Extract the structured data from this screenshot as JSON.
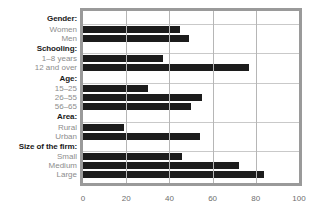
{
  "chart_data": {
    "type": "bar",
    "orientation": "horizontal",
    "title": "",
    "xlabel": "",
    "ylabel": "",
    "xlim": [
      0,
      100
    ],
    "xticks": [
      0,
      20,
      40,
      60,
      80,
      100
    ],
    "grid": true,
    "legend": false,
    "groups": [
      {
        "header": "Gender:",
        "categories": [
          "Women",
          "Men"
        ],
        "values": [
          45,
          49
        ]
      },
      {
        "header": "Schooling:",
        "categories": [
          "1–8 years",
          "12 and over"
        ],
        "values": [
          37,
          77
        ]
      },
      {
        "header": "Age:",
        "categories": [
          "15–25",
          "26–55",
          "56–65"
        ],
        "values": [
          30,
          55,
          50
        ]
      },
      {
        "header": "Area:",
        "categories": [
          "Rural",
          "Urban"
        ],
        "values": [
          19,
          54
        ]
      },
      {
        "header": "Size of the firm:",
        "categories": [
          "Small",
          "Medium",
          "Large"
        ],
        "values": [
          46,
          72,
          84
        ]
      }
    ],
    "categories": [
      "Women",
      "Men",
      "1–8 years",
      "12 and over",
      "15–25",
      "26–55",
      "56–65",
      "Rural",
      "Urban",
      "Small",
      "Medium",
      "Large"
    ],
    "values": [
      45,
      49,
      37,
      77,
      30,
      55,
      50,
      19,
      54,
      46,
      72,
      84
    ],
    "colors": {
      "bar": "#1c1c1c",
      "frame": "#9a9a9a",
      "gridline": "#b6b6b6",
      "group_label": "#1a1a1a",
      "item_label": "#8c8c8c",
      "tick_label": "#6e6e6e",
      "background": "#ffffff"
    }
  }
}
